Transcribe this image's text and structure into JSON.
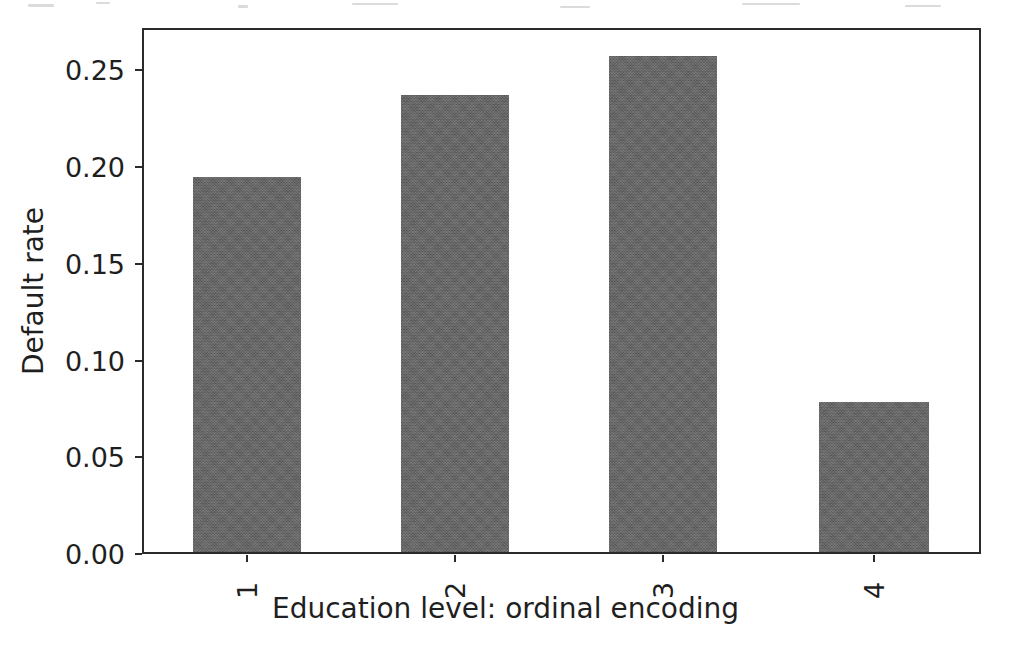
{
  "chart_data": {
    "type": "bar",
    "title": "",
    "subtitle": "",
    "xlabel": "Education level: ordinal encoding",
    "ylabel": "Default rate",
    "categories": [
      "1",
      "2",
      "3",
      "4"
    ],
    "values": [
      0.195,
      0.238,
      0.258,
      0.078
    ],
    "series": [
      {
        "name": "Default rate",
        "values": [
          0.195,
          0.238,
          0.258,
          0.078
        ]
      }
    ],
    "ylim": [
      0.0,
      0.2716
    ],
    "xlim": [
      0.5,
      4.5
    ],
    "ytick_labels": [
      "0.00",
      "0.05",
      "0.10",
      "0.15",
      "0.20",
      "0.25"
    ],
    "ytick_values": [
      0.0,
      0.05,
      0.1,
      0.15,
      0.2,
      0.25
    ],
    "xtick_labels": [
      "1",
      "2",
      "3",
      "4"
    ],
    "xtick_rotation": 90,
    "grid": false,
    "legend": false,
    "legend_position": "none",
    "bar_color": "#636363",
    "axes_color": "#2b2b2b",
    "background_color": "#ffffff",
    "annotations": []
  }
}
